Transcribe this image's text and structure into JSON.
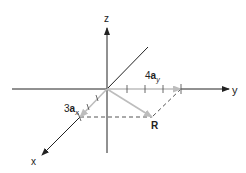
{
  "diagram": {
    "axes": {
      "z_label": "z",
      "y_label": "y",
      "x_label": "x"
    },
    "vectors": {
      "ay": {
        "coef": "4",
        "base": "a",
        "sub": "y"
      },
      "ax": {
        "coef": "3",
        "base": "a",
        "sub": "x"
      },
      "r": {
        "label": "R"
      }
    },
    "colors": {
      "axis": "#222222",
      "vector": "#b8b8b8",
      "dashed": "#555555"
    }
  }
}
